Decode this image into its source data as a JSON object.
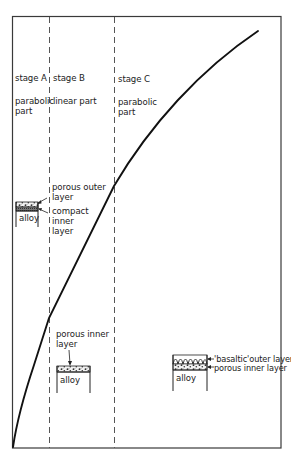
{
  "stages": [
    {
      "title": "stage A",
      "part_line1": "parabolic",
      "part_line2": "part"
    },
    {
      "title": "stage B",
      "part_line1": "linear part",
      "part_line2": ""
    },
    {
      "title": "stage C",
      "part_line1": "parabolic",
      "part_line2": "part"
    }
  ],
  "stage_a_inset": {
    "outer_label_line1": "porous outer",
    "outer_label_line2": "layer",
    "inner_label_line1": "compact",
    "inner_label_line2": "inner",
    "inner_label_line3": "layer",
    "substrate_label": "alloy"
  },
  "stage_b_inset": {
    "layer_label_line1": "porous inner",
    "layer_label_line2": "layer",
    "substrate_label": "alloy"
  },
  "stage_c_inset": {
    "outer_label": "'basaltic'outer layer",
    "inner_label": "porous inner layer",
    "substrate_label": "alloy"
  },
  "colors": {
    "line": "#1a1a1a",
    "frame": "#333333",
    "dash": "#555555",
    "background": "#ffffff"
  }
}
